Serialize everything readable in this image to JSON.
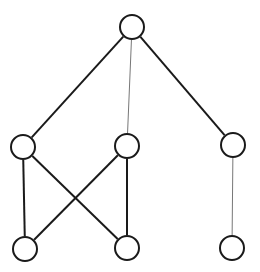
{
  "canvas": {
    "width": 260,
    "height": 272,
    "background_color": "#ffffff"
  },
  "diagram": {
    "node_count": 7,
    "edge_count": 8,
    "node_radius": 13,
    "node_fill_color": "#ffffff",
    "node_stroke_color": "#1a1a1a",
    "node_stroke_width": 2,
    "edge_color_strong": "#1a1a1a",
    "edge_color_light": "#777777",
    "edge_width_strong": 2,
    "edge_width_light": 1
  },
  "chart_data": {
    "type": "graph",
    "layout": "layered",
    "directed": false,
    "xlim": [
      0,
      260
    ],
    "ylim": [
      0,
      272
    ],
    "grid": false,
    "legend": "none",
    "nodes": [
      {
        "id": "n0",
        "label": "",
        "layer": 0,
        "x": 132,
        "y": 27,
        "r": 13,
        "degree": 3
      },
      {
        "id": "n1",
        "label": "",
        "layer": 1,
        "x": 23,
        "y": 147,
        "r": 13,
        "degree": 3
      },
      {
        "id": "n2",
        "label": "",
        "layer": 1,
        "x": 127,
        "y": 146,
        "r": 13,
        "degree": 3
      },
      {
        "id": "n3",
        "label": "",
        "layer": 1,
        "x": 233,
        "y": 145,
        "r": 13,
        "degree": 2
      },
      {
        "id": "n4",
        "label": "",
        "layer": 2,
        "x": 25,
        "y": 249,
        "r": 13,
        "degree": 2
      },
      {
        "id": "n5",
        "label": "",
        "layer": 2,
        "x": 127,
        "y": 248,
        "r": 13,
        "degree": 2
      },
      {
        "id": "n6",
        "label": "",
        "layer": 2,
        "x": 232,
        "y": 248,
        "r": 13,
        "degree": 1
      }
    ],
    "edges": [
      {
        "id": "e0",
        "source": "n0",
        "target": "n1",
        "weight": "strong"
      },
      {
        "id": "e1",
        "source": "n0",
        "target": "n2",
        "weight": "light"
      },
      {
        "id": "e2",
        "source": "n0",
        "target": "n3",
        "weight": "strong"
      },
      {
        "id": "e3",
        "source": "n1",
        "target": "n4",
        "weight": "strong"
      },
      {
        "id": "e4",
        "source": "n1",
        "target": "n5",
        "weight": "strong"
      },
      {
        "id": "e5",
        "source": "n2",
        "target": "n4",
        "weight": "strong"
      },
      {
        "id": "e6",
        "source": "n2",
        "target": "n5",
        "weight": "strong"
      },
      {
        "id": "e7",
        "source": "n3",
        "target": "n6",
        "weight": "light"
      }
    ]
  }
}
